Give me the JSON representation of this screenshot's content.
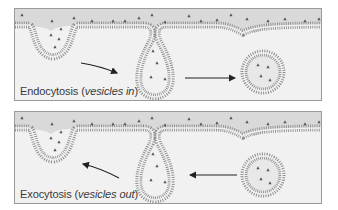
{
  "panels": [
    {
      "id": "endocytosis",
      "caption_main": "Endocytosis",
      "caption_paren_open": " (",
      "caption_italic": "vesicles in",
      "caption_paren_close": ")",
      "arrow_direction": "right"
    },
    {
      "id": "exocytosis",
      "caption_main": "Exocytosis",
      "caption_paren_open": "  (",
      "caption_italic": "vesicles out",
      "caption_paren_close": ")",
      "arrow_direction": "left"
    }
  ],
  "colors": {
    "panel_bg": "#f1f1f1",
    "extracellular": "#d9d9d9",
    "membrane": "#8c8c8c",
    "particle": "#555555",
    "arrow": "#222222",
    "border": "#9a9a9a"
  }
}
